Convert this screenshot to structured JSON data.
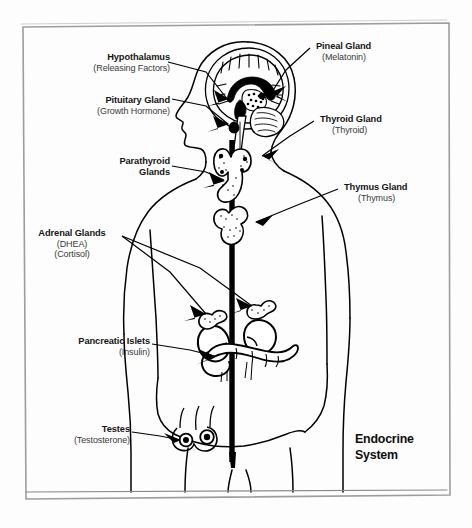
{
  "figure": {
    "title_line1": "Endocrine",
    "title_line2": "System",
    "border_color": "#9a9a9a",
    "ink_color": "#000000",
    "page_background": "#fdfdfd"
  },
  "labels": [
    {
      "id": "hypothalamus",
      "main": "Hypothalamus",
      "sub1": "(Releasing Factors)",
      "align": "right"
    },
    {
      "id": "pituitary-gland",
      "main": "Pituitary Gland",
      "sub1": "(Growth Hormone)",
      "align": "right"
    },
    {
      "id": "parathyroid-glands",
      "main": "Parathyroid",
      "main2": "Glands",
      "align": "right"
    },
    {
      "id": "adrenal-glands",
      "main": "Adrenal Glands",
      "sub1": "(DHEA)",
      "sub2": "(Cortisol)",
      "align": "center"
    },
    {
      "id": "pancreatic-islets",
      "main": "Pancreatic Islets",
      "sub1": "(Insulin)",
      "align": "right"
    },
    {
      "id": "testes",
      "main": "Testes",
      "sub1": "(Testosterone)",
      "align": "right"
    },
    {
      "id": "pineal-gland",
      "main": "Pineal Gland",
      "sub1": "(Melatonin)",
      "align": "left"
    },
    {
      "id": "thyroid-gland",
      "main": "Thyroid Gland",
      "sub1": "(Thyroid)",
      "align": "left"
    },
    {
      "id": "thymus-gland",
      "main": "Thymus Gland",
      "sub1": "(Thymus)",
      "align": "left"
    }
  ],
  "anatomy": {
    "figure_description": "male human body in anterior view with head in left profile",
    "parts": [
      "head-profile",
      "brain-sagittal-section",
      "spine",
      "thyroid",
      "thymus",
      "adrenal-glands",
      "kidneys",
      "pancreas",
      "testes"
    ]
  }
}
